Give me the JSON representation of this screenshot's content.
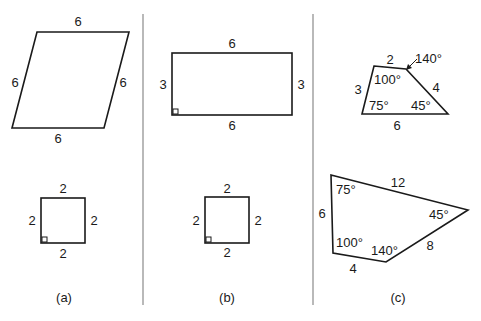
{
  "panels": [
    {
      "caption": "(a)",
      "shapes": [
        {
          "name": "parallelogram",
          "sides": {
            "top": "6",
            "left": "6",
            "right": "6",
            "bottom": "6"
          }
        },
        {
          "name": "square",
          "sides": {
            "top": "2",
            "left": "2",
            "right": "2",
            "bottom": "2"
          },
          "right_angle": true
        }
      ]
    },
    {
      "caption": "(b)",
      "shapes": [
        {
          "name": "rectangle",
          "sides": {
            "top": "6",
            "left": "3",
            "right": "3",
            "bottom": "6"
          },
          "right_angle": true
        },
        {
          "name": "square",
          "sides": {
            "top": "2",
            "left": "2",
            "right": "2",
            "bottom": "2"
          },
          "right_angle": true
        }
      ]
    },
    {
      "caption": "(c)",
      "shapes": [
        {
          "name": "small-quadrilateral",
          "sides": {
            "top": "2",
            "left": "3",
            "right": "4",
            "bottom": "6"
          },
          "angles": {
            "top_left": "100°",
            "top_right": "140°",
            "bottom_right": "45°",
            "bottom_left": "75°"
          }
        },
        {
          "name": "large-quadrilateral",
          "sides": {
            "top": "12",
            "left": "6",
            "lower_right": "8",
            "bottom": "4"
          },
          "angles": {
            "top_left": "75°",
            "right": "45°",
            "bottom_right": "140°",
            "bottom_left": "100°"
          }
        }
      ]
    }
  ]
}
